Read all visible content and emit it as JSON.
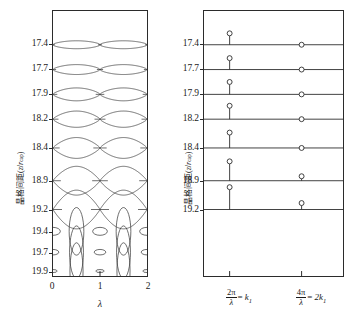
{
  "figure": {
    "background": "#ffffff",
    "line_color": "#2b2b2b",
    "curve_color": "#3a3a3a"
  },
  "chart_data": [
    {
      "id": "left-panel",
      "type": "line",
      "title": "",
      "xlabel": "λ",
      "ylabel": "晶格间距(z/r_cap)",
      "xlim": [
        0,
        2
      ],
      "ylim": [
        0,
        10
      ],
      "grid": false,
      "xticks": [
        "0",
        "1",
        "2"
      ],
      "yticks": [
        "17.4",
        "17.7",
        "17.9",
        "18.2",
        "18.4",
        "18.9",
        "19.2",
        "19.4",
        "19.7",
        "19.9"
      ],
      "legend": "none",
      "description": "Ten stacked band rows; each row is a pair of mirrored curves that bound closed lens/eye shapes. Amplitude grows from small sinusoidal ripples at the top (17.4) to wide circles at 19.2 and tall ellipses at 19.9.",
      "series": [
        {
          "name": "17.4",
          "y_level": 17.4,
          "amplitude": 0.085,
          "shape": "sine-pair",
          "contacts": 4
        },
        {
          "name": "17.7",
          "y_level": 17.7,
          "amplitude": 0.105,
          "shape": "sine-pair",
          "contacts": 4
        },
        {
          "name": "17.9",
          "y_level": 17.9,
          "amplitude": 0.135,
          "shape": "sine-pair",
          "contacts": 4
        },
        {
          "name": "18.2",
          "y_level": 18.2,
          "amplitude": 0.17,
          "shape": "lens-pair",
          "contacts": 4
        },
        {
          "name": "18.4",
          "y_level": 18.4,
          "amplitude": 0.21,
          "shape": "lens-pair",
          "contacts": 4
        },
        {
          "name": "18.9",
          "y_level": 18.9,
          "amplitude": 0.3,
          "shape": "loop-pair",
          "contacts": 4
        },
        {
          "name": "19.2",
          "y_level": 19.2,
          "amplitude": 0.42,
          "shape": "circle-pair",
          "contacts": 4
        },
        {
          "name": "19.4",
          "y_level": 19.4,
          "amplitude": 0.55,
          "shape": "ellipse-row",
          "contacts": 5
        },
        {
          "name": "19.7",
          "y_level": 19.7,
          "amplitude": 0.62,
          "shape": "ellipse-row",
          "contacts": 5
        },
        {
          "name": "19.9",
          "y_level": 19.9,
          "amplitude": 0.7,
          "shape": "ellipse-row",
          "contacts": 5
        }
      ]
    },
    {
      "id": "right-panel",
      "type": "scatter",
      "title": "",
      "xlabel": "",
      "ylabel": "晶格间距(z/r_cap)",
      "grid": false,
      "xticks": [
        "2π/λ = k₁",
        "4π/λ = 2k₁"
      ],
      "yticks": [
        "17.4",
        "17.7",
        "17.9",
        "18.2",
        "18.4",
        "18.9",
        "19.2"
      ],
      "legend": "none",
      "description": "Seven horizontal reference lines, one per y-tick, spanning the panel width. Each line carries two open-circle markers: one at k1 raised above the line on a vertical stem, one at 2k1 sitting on or just above the line.",
      "series": [
        {
          "name": "k1 branch",
          "marker": "open-circle",
          "x_label": "2π/λ = k₁",
          "points": [
            {
              "row": "17.4",
              "stem_height": 9
            },
            {
              "row": "17.7",
              "stem_height": 9
            },
            {
              "row": "17.9",
              "stem_height": 10
            },
            {
              "row": "18.2",
              "stem_height": 11
            },
            {
              "row": "18.4",
              "stem_height": 13
            },
            {
              "row": "18.9",
              "stem_height": 17
            },
            {
              "row": "19.2",
              "stem_height": 20
            }
          ]
        },
        {
          "name": "2k1 branch",
          "marker": "open-circle",
          "x_label": "4π/λ = 2k₁",
          "points": [
            {
              "row": "17.4",
              "stem_height": 0
            },
            {
              "row": "17.7",
              "stem_height": 0
            },
            {
              "row": "17.9",
              "stem_height": 0
            },
            {
              "row": "18.2",
              "stem_height": 0
            },
            {
              "row": "18.4",
              "stem_height": 0
            },
            {
              "row": "18.9",
              "stem_height": 2
            },
            {
              "row": "19.2",
              "stem_height": 4
            }
          ]
        }
      ]
    }
  ],
  "left_panel": {
    "yticks": [
      "17.4",
      "17.7",
      "17.9",
      "18.2",
      "18.4",
      "18.9",
      "19.2",
      "19.4",
      "19.7",
      "19.9"
    ],
    "xticks": [
      "0",
      "1",
      "2"
    ],
    "xlabel": "λ",
    "ylabel_prefix": "晶格间距(",
    "ylabel_var": "z",
    "ylabel_slash": "/",
    "ylabel_var2": "r",
    "ylabel_sub": "cap",
    "ylabel_suffix": ")"
  },
  "right_panel": {
    "yticks": [
      "17.4",
      "17.7",
      "17.9",
      "18.2",
      "18.4",
      "18.9",
      "19.2"
    ],
    "xtick1": {
      "num": "2π",
      "den": "λ",
      "eq": "=",
      "sym": "k",
      "sub": "1"
    },
    "xtick2": {
      "num": "4π",
      "den": "λ",
      "eq": "=",
      "sym": "2k",
      "sub": "1"
    },
    "ylabel_prefix": "晶格间距(",
    "ylabel_var": "z",
    "ylabel_slash": "/",
    "ylabel_var2": "r",
    "ylabel_sub": "cap",
    "ylabel_suffix": ")"
  }
}
